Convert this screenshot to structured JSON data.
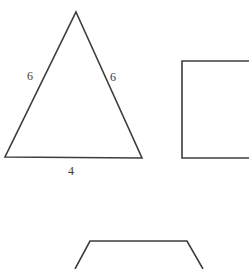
{
  "canvas": {
    "width": 249,
    "height": 269,
    "background": "#ffffff",
    "stroke_color": "#3d3d3d",
    "text_color": "#3a3a3a"
  },
  "figures": [
    {
      "name": "isosceles-triangle",
      "type": "triangle",
      "vertices": [
        [
          76,
          12
        ],
        [
          142,
          158
        ],
        [
          5,
          157
        ]
      ],
      "labels": [
        {
          "name": "left-side-length",
          "text": "6",
          "x": 27,
          "y": 70
        },
        {
          "name": "right-side-length",
          "text": "6",
          "x": 110,
          "y": 71
        },
        {
          "name": "base-length",
          "text": "4",
          "x": 68,
          "y": 165
        }
      ]
    },
    {
      "name": "square",
      "type": "rectangle",
      "points": [
        [
          249,
          61
        ],
        [
          182,
          61
        ],
        [
          182,
          158
        ],
        [
          249,
          158
        ]
      ],
      "clipped_edge": "right",
      "labels": []
    },
    {
      "name": "trapezoid",
      "type": "polyline",
      "points": [
        [
          75,
          269
        ],
        [
          90,
          241
        ],
        [
          187,
          241
        ],
        [
          203,
          269
        ]
      ],
      "clipped_edge": "bottom",
      "labels": []
    }
  ],
  "labels": {
    "triangle_left": "6",
    "triangle_right": "6",
    "triangle_base": "4"
  }
}
